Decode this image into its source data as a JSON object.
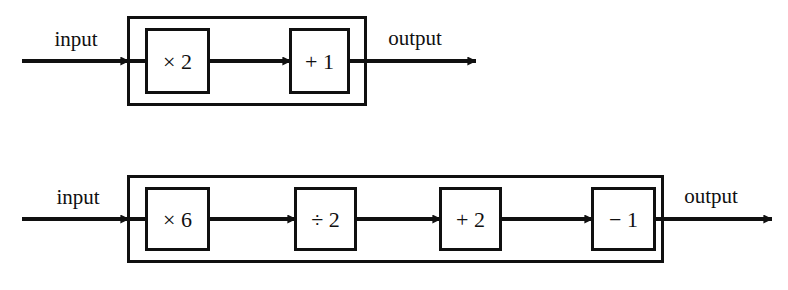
{
  "page": {
    "background_color": "#ffffff",
    "ink_color": "#101010",
    "width": 788,
    "height": 290
  },
  "diagrams": [
    {
      "id": "function-machine-1",
      "name": "two-stage-function-machine",
      "input_label": "input",
      "output_label": "output",
      "operations": [
        {
          "label": "× 2",
          "operator": "multiply",
          "operand": "2"
        },
        {
          "label": "+ 1",
          "operator": "add",
          "operand": "1"
        }
      ]
    },
    {
      "id": "function-machine-2",
      "name": "four-stage-function-machine",
      "input_label": "input",
      "output_label": "output",
      "operations": [
        {
          "label": "× 6",
          "operator": "multiply",
          "operand": "6"
        },
        {
          "label": "÷ 2",
          "operator": "divide",
          "operand": "2"
        },
        {
          "label": "+ 2",
          "operator": "add",
          "operand": "2"
        },
        {
          "label": "− 1",
          "operator": "subtract",
          "operand": "1"
        }
      ]
    }
  ]
}
